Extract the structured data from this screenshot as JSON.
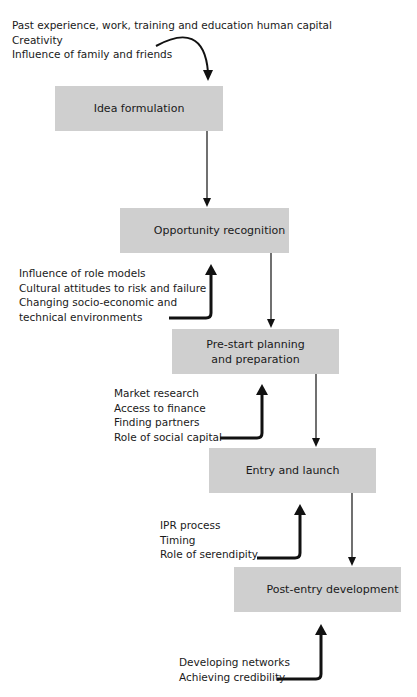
{
  "stages": [
    {
      "label": "Idea formulation"
    },
    {
      "label": "Opportunity recognition"
    },
    {
      "label": "Pre-start planning and preparation"
    },
    {
      "label": "Entry and launch"
    },
    {
      "label": "Post-entry development"
    }
  ],
  "influences": [
    {
      "target": "Idea formulation",
      "items": [
        "Past experience, work, training and education human capital",
        "Creativity",
        "Influence of family and friends"
      ]
    },
    {
      "target": "Opportunity recognition",
      "items": [
        "Influence of role models",
        "Cultural attitudes to risk and failure",
        "Changing socio-economic and",
        "technical environments"
      ]
    },
    {
      "target": "Pre-start planning and preparation",
      "items": [
        "Market research",
        "Access to finance",
        "Finding partners",
        "Role of social capital"
      ]
    },
    {
      "target": "Entry and launch",
      "items": [
        "IPR process",
        "Timing",
        "Role of serendipity"
      ]
    },
    {
      "target": "Post-entry development",
      "items": [
        "Developing networks",
        "Achieving credibility"
      ]
    }
  ],
  "colors": {
    "box_fill": "#cfcfcf",
    "arrow": "#111111"
  }
}
